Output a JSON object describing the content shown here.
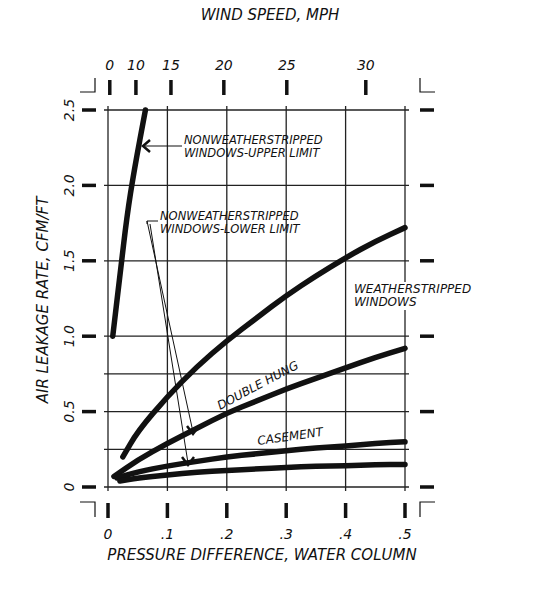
{
  "chart_data": {
    "type": "line",
    "title": "",
    "xlabel": "PRESSURE DIFFERENCE, WATER COLUMN",
    "ylabel": "AIR LEAKAGE RATE, CFM/FT",
    "x2label": "WIND SPEED, MPH",
    "xlim": [
      0,
      0.5
    ],
    "ylim": [
      0,
      2.5
    ],
    "grid": true,
    "x_ticks": [
      {
        "value": 0,
        "label": "0"
      },
      {
        "value": 0.1,
        "label": ".1"
      },
      {
        "value": 0.2,
        "label": ".2"
      },
      {
        "value": 0.3,
        "label": ".3"
      },
      {
        "value": 0.4,
        "label": ".4"
      },
      {
        "value": 0.5,
        "label": ".5"
      }
    ],
    "y_ticks": [
      {
        "value": 0,
        "label": "0"
      },
      {
        "value": 0.5,
        "label": "0.5"
      },
      {
        "value": 1.0,
        "label": "1.0"
      },
      {
        "value": 1.5,
        "label": "1.5"
      },
      {
        "value": 2.0,
        "label": "2.0"
      },
      {
        "value": 2.5,
        "label": "2.5"
      }
    ],
    "y_gridlines": [
      0,
      0.25,
      0.5,
      0.75,
      1.0,
      1.5,
      2.0,
      2.5
    ],
    "x2_ticks": [
      {
        "pressure": 0.003,
        "label": "0"
      },
      {
        "pressure": 0.047,
        "label": "10"
      },
      {
        "pressure": 0.106,
        "label": "15"
      },
      {
        "pressure": 0.195,
        "label": "20"
      },
      {
        "pressure": 0.301,
        "label": "25"
      },
      {
        "pressure": 0.434,
        "label": "30"
      }
    ],
    "series": [
      {
        "name": "Nonweatherstripped windows - upper limit",
        "x": [
          0.008,
          0.02,
          0.032,
          0.044,
          0.063
        ],
        "y": [
          1.0,
          1.4,
          1.8,
          2.1,
          2.5
        ]
      },
      {
        "name": "Weatherstripped windows - upper bound",
        "x": [
          0.025,
          0.05,
          0.1,
          0.15,
          0.2,
          0.25,
          0.3,
          0.35,
          0.4,
          0.45,
          0.5
        ],
        "y": [
          0.2,
          0.37,
          0.6,
          0.8,
          0.97,
          1.12,
          1.27,
          1.4,
          1.52,
          1.63,
          1.72
        ]
      },
      {
        "name": "Double hung",
        "x": [
          0.01,
          0.05,
          0.1,
          0.15,
          0.2,
          0.25,
          0.3,
          0.35,
          0.4,
          0.45,
          0.5
        ],
        "y": [
          0.07,
          0.18,
          0.29,
          0.39,
          0.49,
          0.57,
          0.65,
          0.72,
          0.79,
          0.86,
          0.92
        ]
      },
      {
        "name": "Casement",
        "x": [
          0.015,
          0.05,
          0.1,
          0.15,
          0.2,
          0.25,
          0.3,
          0.35,
          0.4,
          0.45,
          0.5
        ],
        "y": [
          0.06,
          0.1,
          0.14,
          0.17,
          0.2,
          0.22,
          0.24,
          0.26,
          0.27,
          0.29,
          0.3
        ]
      },
      {
        "name": "Nonweatherstripped windows - lower limit",
        "x": [
          0.02,
          0.05,
          0.1,
          0.15,
          0.2,
          0.25,
          0.3,
          0.35,
          0.4,
          0.45,
          0.5
        ],
        "y": [
          0.04,
          0.06,
          0.08,
          0.1,
          0.11,
          0.12,
          0.13,
          0.14,
          0.14,
          0.15,
          0.15
        ]
      }
    ],
    "annotations": [
      {
        "text_lines": [
          "NONWEATHERSTRIPPED",
          "WINDOWS-UPPER LIMIT"
        ],
        "points_to": "Nonweatherstripped windows - upper limit"
      },
      {
        "text_lines": [
          "NONWEATHERSTRIPPED",
          "WINDOWS-LOWER LIMIT"
        ],
        "points_to": [
          "Double hung",
          "Nonweatherstripped windows - lower limit"
        ]
      },
      {
        "text_lines": [
          "WEATHERSTRIPPED",
          "WINDOWS"
        ]
      },
      {
        "text": "DOUBLE HUNG"
      },
      {
        "text": "CASEMENT"
      }
    ]
  }
}
